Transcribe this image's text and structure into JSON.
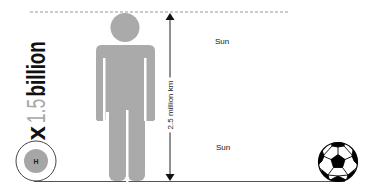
{
  "multiplier": {
    "prefix": "x",
    "number": "1.5",
    "unit": "billion"
  },
  "distance_label": "2.5 million km",
  "sun_labels": {
    "top": "Sun",
    "bottom": "Sun"
  },
  "hydrogen_label": "H",
  "colors": {
    "human": "#aaaaaa",
    "hydrogen_core": "#a6a6a6",
    "text_dark": "#111111",
    "text_gray": "#a8a8a8",
    "ground_line": "#555555",
    "dashed_line": "#999999"
  }
}
